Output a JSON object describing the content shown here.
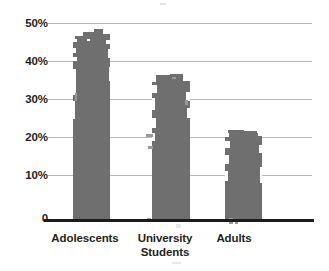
{
  "chart_data": {
    "type": "bar",
    "title": "",
    "subtitle": "",
    "xlabel": "",
    "ylabel": "",
    "categories": [
      "Adolescents",
      "University Students",
      "Adults"
    ],
    "values": [
      46,
      36,
      22
    ],
    "value_labels": [
      "46%",
      "36%",
      "22%"
    ],
    "series": [
      {
        "name": "Prevalence",
        "values": [
          46,
          36,
          22
        ]
      }
    ],
    "ylim": [
      0,
      50
    ],
    "y_ticks": [
      0,
      10,
      20,
      30,
      40,
      50
    ],
    "y_tick_labels": [
      "0",
      "10%",
      "20%",
      "30%",
      "40%",
      "50%"
    ],
    "grid": true,
    "legend": false,
    "legend_position": "none",
    "bar_color": "#6f6f6f",
    "gridline_color": "#b9b9b9",
    "axis_color": "#1b1b1b",
    "text_color": "#231f20",
    "background": "#ffffff"
  },
  "axis": {
    "y_labels": {
      "t50": "50%",
      "t40": "40%",
      "t30": "30%",
      "t20": "20%",
      "t10": "10%",
      "t0": "0"
    },
    "x_labels": {
      "cat0_line1": "Adolescents",
      "cat1_line1": "University",
      "cat1_line2": "Students",
      "cat2_line1": "Adults"
    }
  }
}
